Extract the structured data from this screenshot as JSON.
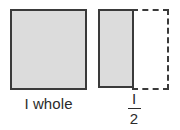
{
  "figure": {
    "background_color": "#ffffff",
    "fill_color": "#dcdcdc",
    "stroke_color": "#3a3a3a",
    "text_color": "#2b2b2b"
  },
  "whole": {
    "label": "I whole",
    "shape": "square",
    "fill": "shaded",
    "border_style": "solid"
  },
  "half": {
    "shaded_part": {
      "shape": "rectangle",
      "fill": "shaded",
      "border_style": "solid"
    },
    "unshaded_part": {
      "shape": "rectangle",
      "fill": "none",
      "border_style": "dashed"
    },
    "fraction": {
      "numerator": "I",
      "denominator": "2"
    }
  }
}
